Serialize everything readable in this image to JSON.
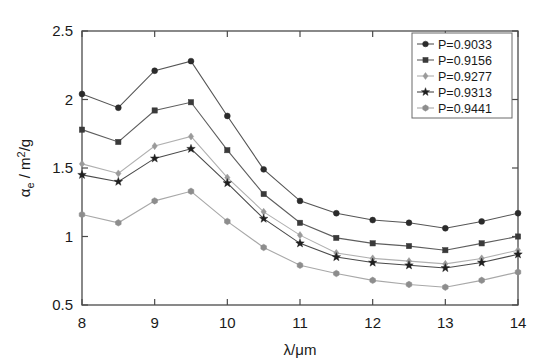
{
  "chart_data": {
    "type": "line",
    "title": "",
    "xlabel": "λ/μm",
    "ylabel": "αe / m2/g",
    "ylabel_parts": {
      "symbol": "α",
      "subscript": "e",
      "rest": "/ m",
      "superscript": "2",
      "tail": "/g"
    },
    "xlim": [
      8,
      14
    ],
    "ylim": [
      0.5,
      2.5
    ],
    "xticks": [
      8,
      9,
      10,
      11,
      12,
      13,
      14
    ],
    "xtick_labels": [
      "8",
      "9",
      "10",
      "11",
      "12",
      "13",
      "14"
    ],
    "yticks": [
      0.5,
      1,
      1.5,
      2,
      2.5
    ],
    "ytick_labels": [
      "0.5",
      "1",
      "1.5",
      "2",
      "2.5"
    ],
    "grid": false,
    "legend_position": "top-right",
    "x": [
      8,
      8.5,
      9,
      9.5,
      10,
      10.5,
      11,
      11.5,
      12,
      12.5,
      13,
      13.5,
      14
    ],
    "series": [
      {
        "name": "P=0.9033",
        "marker": "circle",
        "color": "#2b2b2b",
        "line_color": "#555555",
        "values": [
          2.04,
          1.94,
          2.21,
          2.28,
          1.88,
          1.49,
          1.26,
          1.17,
          1.12,
          1.1,
          1.06,
          1.11,
          1.17
        ]
      },
      {
        "name": "P=0.9156",
        "marker": "square",
        "color": "#3a3a3a",
        "line_color": "#5e5e5e",
        "values": [
          1.78,
          1.69,
          1.92,
          1.98,
          1.63,
          1.31,
          1.1,
          0.99,
          0.95,
          0.93,
          0.9,
          0.95,
          1.0
        ]
      },
      {
        "name": "P=0.9277",
        "marker": "diamond",
        "color": "#9a9a9a",
        "line_color": "#b0b0b0",
        "values": [
          1.53,
          1.46,
          1.66,
          1.73,
          1.43,
          1.18,
          1.01,
          0.88,
          0.84,
          0.82,
          0.8,
          0.84,
          0.9
        ]
      },
      {
        "name": "P=0.9313",
        "marker": "star",
        "color": "#1f1f1f",
        "line_color": "#4a4a4a",
        "values": [
          1.45,
          1.4,
          1.57,
          1.64,
          1.39,
          1.13,
          0.95,
          0.85,
          0.81,
          0.79,
          0.77,
          0.81,
          0.87
        ]
      },
      {
        "name": "P=0.9441",
        "marker": "hexagon",
        "color": "#8d8d8d",
        "line_color": "#a8a8a8",
        "values": [
          1.16,
          1.1,
          1.26,
          1.33,
          1.11,
          0.92,
          0.79,
          0.73,
          0.68,
          0.65,
          0.63,
          0.68,
          0.74
        ]
      }
    ]
  }
}
